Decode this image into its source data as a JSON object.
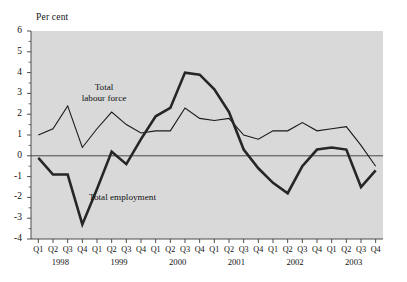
{
  "chart_data": {
    "type": "line",
    "title": "",
    "subtitle": "",
    "xlabel": "",
    "ylabel": "Per cent",
    "unit_label": "Per cent",
    "ylim": [
      -4,
      6
    ],
    "ytick_values": [
      6,
      5,
      4,
      3,
      2,
      1,
      0,
      -1,
      -2,
      -3,
      -4
    ],
    "ytick_labels": [
      "6",
      "5",
      "4",
      "3",
      "2",
      "1",
      "0",
      "-1",
      "-2",
      "-3",
      "-4"
    ],
    "grid": false,
    "zero_line": true,
    "legend_position": "inline-annotation",
    "plot_background": "#d9d9d9",
    "categories": [
      "Q1",
      "Q2",
      "Q3",
      "Q4",
      "Q1",
      "Q2",
      "Q3",
      "Q4",
      "Q1",
      "Q2",
      "Q3",
      "Q4",
      "Q1",
      "Q2",
      "Q3",
      "Q4",
      "Q1",
      "Q2",
      "Q3",
      "Q4",
      "Q1",
      "Q2",
      "Q3",
      "Q4"
    ],
    "year_groups": [
      {
        "label": "1998",
        "start_index": 0,
        "end_index": 3
      },
      {
        "label": "1999",
        "start_index": 4,
        "end_index": 7
      },
      {
        "label": "2000",
        "start_index": 8,
        "end_index": 11
      },
      {
        "label": "2001",
        "start_index": 12,
        "end_index": 15
      },
      {
        "label": "2002",
        "start_index": 16,
        "end_index": 19
      },
      {
        "label": "2003",
        "start_index": 20,
        "end_index": 23
      }
    ],
    "series": [
      {
        "name": "Total labour force",
        "style": "thin",
        "color": "#1a1a1a",
        "line_width": 1.1,
        "values": [
          1.0,
          1.3,
          2.4,
          0.4,
          1.3,
          2.1,
          1.5,
          1.1,
          1.2,
          1.2,
          2.3,
          1.8,
          1.7,
          1.8,
          1.0,
          0.8,
          1.2,
          1.2,
          1.6,
          1.2,
          1.3,
          1.4,
          0.5,
          -0.5
        ]
      },
      {
        "name": "Total employment",
        "style": "thick",
        "color": "#262626",
        "line_width": 2.6,
        "values": [
          -0.1,
          -0.9,
          -0.9,
          -3.3,
          -1.6,
          0.2,
          -0.4,
          0.8,
          1.9,
          2.3,
          4.0,
          3.9,
          3.2,
          2.1,
          0.3,
          -0.6,
          -1.3,
          -1.8,
          -0.5,
          0.3,
          0.4,
          0.3,
          -1.5,
          -0.7
        ]
      }
    ],
    "annotations": [
      {
        "name": "Total labour force",
        "text_line1": "Total",
        "text_line2": "labour force"
      },
      {
        "name": "Total employment",
        "text_line1": "Total employment",
        "text_line2": ""
      }
    ]
  }
}
